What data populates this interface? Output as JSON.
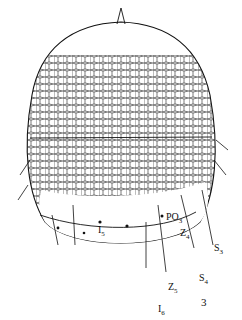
{
  "figure": {
    "figure_number": "3",
    "labels": [
      {
        "id": "I5",
        "base": "I",
        "sub": "5"
      },
      {
        "id": "PO3",
        "base": "PO",
        "sub": "3"
      },
      {
        "id": "Z4",
        "base": "Z",
        "sub": "4"
      },
      {
        "id": "S3",
        "base": "S",
        "sub": "3"
      },
      {
        "id": "S4",
        "base": "S",
        "sub": "4"
      },
      {
        "id": "Z5",
        "base": "Z",
        "sub": "5"
      },
      {
        "id": "I6",
        "base": "I",
        "sub": "6"
      }
    ]
  }
}
